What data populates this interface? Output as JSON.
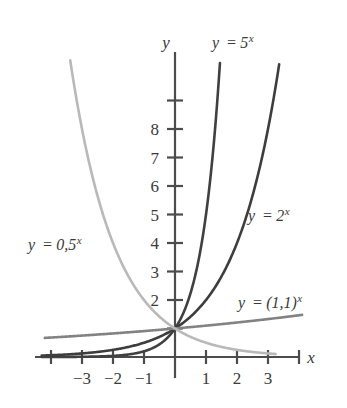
{
  "figure": {
    "title": "",
    "background_color": "#ffffff"
  },
  "axes": {
    "x_label": "x",
    "y_label": "y",
    "x_ticks_labeled": [
      "−3",
      "−2",
      "−1",
      "1",
      "2",
      "3"
    ],
    "x_tick_values": [
      -3,
      -2,
      -1,
      1,
      2,
      3
    ],
    "x_ticks_unlabeled": [
      -4,
      4
    ],
    "y_ticks_labeled": [
      "2",
      "3",
      "4",
      "5",
      "6",
      "7",
      "8"
    ],
    "y_tick_values": [
      2,
      3,
      4,
      5,
      6,
      7,
      8
    ],
    "y_ticks_unlabeled": [
      1,
      9
    ],
    "xlim": [
      -4.45,
      4.6
    ],
    "ylim": [
      -0.75,
      10.4
    ],
    "origin_x_px": 175,
    "origin_y_px": 357,
    "unit_x_px": 31.0,
    "unit_y_px": 28.5,
    "axis_color": "#4c4c4c",
    "grid": false
  },
  "labels": {
    "curve_5": {
      "text": "y = 5",
      "lhs": "y",
      "op": "=",
      "base": "5",
      "exponent": "x",
      "x_px": 212,
      "y_px": 48
    },
    "curve_2": {
      "text": "y = 2",
      "lhs": "y",
      "op": "=",
      "base": "2",
      "exponent": "x",
      "x_px": 248,
      "y_px": 221
    },
    "curve_11": {
      "text": "y = (1,1)",
      "lhs": "y",
      "op": "=",
      "base": "(1,1)",
      "exponent": "x",
      "x_px": 238,
      "y_px": 308
    },
    "curve_05": {
      "text": "y = 0,5",
      "lhs": "y",
      "op": "=",
      "base": "0,5",
      "exponent": "x",
      "x_px": 28,
      "y_px": 250
    }
  },
  "chart_data": {
    "type": "line",
    "title": "",
    "xlabel": "x",
    "ylabel": "y",
    "xlim": [
      -4.45,
      4.6
    ],
    "ylim": [
      -0.75,
      10.4
    ],
    "grid": false,
    "legend": "inline-annotations",
    "xticks": [
      -4,
      -3,
      -2,
      -1,
      0,
      1,
      2,
      3,
      4
    ],
    "xticklabels": [
      "",
      "−3",
      "−2",
      "−1",
      "",
      "1",
      "2",
      "3",
      ""
    ],
    "yticks": [
      1,
      2,
      3,
      4,
      5,
      6,
      7,
      8,
      9
    ],
    "yticklabels": [
      "",
      "2",
      "3",
      "4",
      "5",
      "6",
      "7",
      "8",
      ""
    ],
    "common_point": [
      0,
      1
    ],
    "series": [
      {
        "name": "y = 5^x",
        "label": "y = 5",
        "base": 5,
        "color": "#404040",
        "linewidth": 2.6,
        "x_domain": [
          -4.3,
          1.45
        ],
        "points": [
          {
            "x": -4.3,
            "y": 0.0021
          },
          {
            "x": -4.0,
            "y": 0.0016
          },
          {
            "x": -3.5,
            "y": 0.0036
          },
          {
            "x": -3.0,
            "y": 0.008
          },
          {
            "x": -2.5,
            "y": 0.0179
          },
          {
            "x": -2.0,
            "y": 0.04
          },
          {
            "x": -1.5,
            "y": 0.0894
          },
          {
            "x": -1.0,
            "y": 0.2
          },
          {
            "x": -0.75,
            "y": 0.299
          },
          {
            "x": -0.5,
            "y": 0.4472
          },
          {
            "x": -0.25,
            "y": 0.6687
          },
          {
            "x": 0.0,
            "y": 1.0
          },
          {
            "x": 0.25,
            "y": 1.4953
          },
          {
            "x": 0.5,
            "y": 2.2361
          },
          {
            "x": 0.75,
            "y": 3.3437
          },
          {
            "x": 1.0,
            "y": 5.0
          },
          {
            "x": 1.25,
            "y": 7.4767
          },
          {
            "x": 1.45,
            "y": 10.23
          }
        ]
      },
      {
        "name": "y = 2^x",
        "label": "y = 2",
        "base": 2,
        "color": "#3d3d3d",
        "linewidth": 2.6,
        "x_domain": [
          -4.3,
          3.36
        ],
        "points": [
          {
            "x": -4.3,
            "y": 0.0508
          },
          {
            "x": -4.0,
            "y": 0.0625
          },
          {
            "x": -3.5,
            "y": 0.0884
          },
          {
            "x": -3.0,
            "y": 0.125
          },
          {
            "x": -2.5,
            "y": 0.1768
          },
          {
            "x": -2.0,
            "y": 0.25
          },
          {
            "x": -1.5,
            "y": 0.3536
          },
          {
            "x": -1.0,
            "y": 0.5
          },
          {
            "x": -0.5,
            "y": 0.7071
          },
          {
            "x": 0.0,
            "y": 1.0
          },
          {
            "x": 0.5,
            "y": 1.4142
          },
          {
            "x": 1.0,
            "y": 2.0
          },
          {
            "x": 1.5,
            "y": 2.8284
          },
          {
            "x": 2.0,
            "y": 4.0
          },
          {
            "x": 2.5,
            "y": 5.6569
          },
          {
            "x": 3.0,
            "y": 8.0
          },
          {
            "x": 3.36,
            "y": 10.27
          }
        ]
      },
      {
        "name": "y = (1,1)^x",
        "label": "y = (1,1)",
        "base": 1.1,
        "color": "#828282",
        "linewidth": 2.6,
        "x_domain": [
          -4.2,
          4.1
        ],
        "points": [
          {
            "x": -4.2,
            "y": 0.683
          },
          {
            "x": -3.0,
            "y": 0.7513
          },
          {
            "x": -2.0,
            "y": 0.8264
          },
          {
            "x": -1.0,
            "y": 0.9091
          },
          {
            "x": 0.0,
            "y": 1.0
          },
          {
            "x": 1.0,
            "y": 1.1
          },
          {
            "x": 2.0,
            "y": 1.21
          },
          {
            "x": 3.0,
            "y": 1.331
          },
          {
            "x": 4.1,
            "y": 1.4827
          }
        ]
      },
      {
        "name": "y = 0,5^x",
        "label": "y = 0,5",
        "base": 0.5,
        "color": "#b9b9b9",
        "linewidth": 2.6,
        "x_domain": [
          -3.38,
          3.25
        ],
        "points": [
          {
            "x": -3.38,
            "y": 10.41
          },
          {
            "x": -3.0,
            "y": 8.0
          },
          {
            "x": -2.5,
            "y": 5.6569
          },
          {
            "x": -2.0,
            "y": 4.0
          },
          {
            "x": -1.5,
            "y": 2.8284
          },
          {
            "x": -1.0,
            "y": 2.0
          },
          {
            "x": -0.5,
            "y": 1.4142
          },
          {
            "x": 0.0,
            "y": 1.0
          },
          {
            "x": 0.5,
            "y": 0.7071
          },
          {
            "x": 1.0,
            "y": 0.5
          },
          {
            "x": 1.5,
            "y": 0.3536
          },
          {
            "x": 2.0,
            "y": 0.25
          },
          {
            "x": 2.5,
            "y": 0.1768
          },
          {
            "x": 3.0,
            "y": 0.125
          },
          {
            "x": 3.25,
            "y": 0.1051
          }
        ]
      }
    ]
  }
}
